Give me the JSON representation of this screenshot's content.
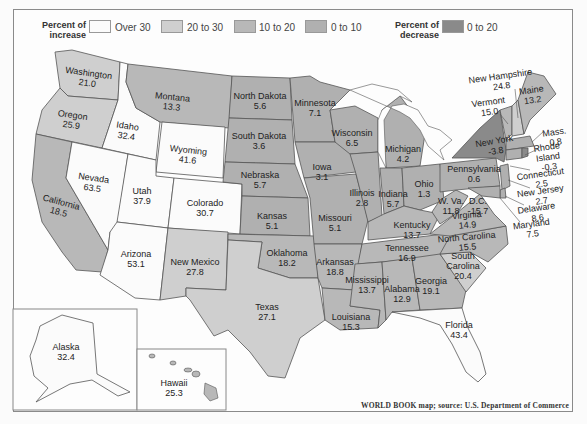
{
  "legend": {
    "increase_title": "Percent of increase",
    "increase_title_line1": "Percent of",
    "increase_title_line2": "increase",
    "decrease_title_line1": "Percent of",
    "decrease_title_line2": "decrease",
    "items": [
      {
        "label": "Over 30",
        "color": "#fbfbfb"
      },
      {
        "label": "20 to 30",
        "color": "#cfcfcf"
      },
      {
        "label": "10 to 20",
        "color": "#b8b8b8"
      },
      {
        "label": "0 to 10",
        "color": "#b0b0b0"
      },
      {
        "label": "0 to 20",
        "color": "#8a8a8a"
      }
    ]
  },
  "states": {
    "washington": {
      "name": "Washington",
      "value": "21.0"
    },
    "oregon": {
      "name": "Oregon",
      "value": "25.9"
    },
    "idaho": {
      "name": "Idaho",
      "value": "32.4"
    },
    "montana": {
      "name": "Montana",
      "value": "13.3"
    },
    "wyoming": {
      "name": "Wyoming",
      "value": "41.6"
    },
    "california": {
      "name": "California",
      "value": "18.5"
    },
    "nevada": {
      "name": "Nevada",
      "value": "63.5"
    },
    "utah": {
      "name": "Utah",
      "value": "37.9"
    },
    "colorado": {
      "name": "Colorado",
      "value": "30.7"
    },
    "arizona": {
      "name": "Arizona",
      "value": "53.1"
    },
    "new_mexico": {
      "name": "New Mexico",
      "value": "27.8"
    },
    "north_dakota": {
      "name": "North Dakota",
      "value": "5.6"
    },
    "south_dakota": {
      "name": "South Dakota",
      "value": "3.6"
    },
    "nebraska": {
      "name": "Nebraska",
      "value": "5.7"
    },
    "kansas": {
      "name": "Kansas",
      "value": "5.1"
    },
    "oklahoma": {
      "name": "Oklahoma",
      "value": "18.2"
    },
    "texas": {
      "name": "Texas",
      "value": "27.1"
    },
    "minnesota": {
      "name": "Minnesota",
      "value": "7.1"
    },
    "iowa": {
      "name": "Iowa",
      "value": "3.1"
    },
    "missouri": {
      "name": "Missouri",
      "value": "5.1"
    },
    "arkansas": {
      "name": "Arkansas",
      "value": "18.8"
    },
    "louisiana": {
      "name": "Louisiana",
      "value": "15.3"
    },
    "wisconsin": {
      "name": "Wisconsin",
      "value": "6.5"
    },
    "illinois": {
      "name": "Illinois",
      "value": "2.8"
    },
    "michigan": {
      "name": "Michigan",
      "value": "4.2"
    },
    "indiana": {
      "name": "Indiana",
      "value": "5.7"
    },
    "ohio": {
      "name": "Ohio",
      "value": "1.3"
    },
    "kentucky": {
      "name": "Kentucky",
      "value": "13.7"
    },
    "tennessee": {
      "name": "Tennessee",
      "value": "16.9"
    },
    "mississippi": {
      "name": "Mississippi",
      "value": "13.7"
    },
    "alabama": {
      "name": "Alabama",
      "value": "12.9"
    },
    "georgia": {
      "name": "Georgia",
      "value": "19.1"
    },
    "florida": {
      "name": "Florida",
      "value": "43.4"
    },
    "south_carolina": {
      "name": "South Carolina",
      "name_line1": "South",
      "name_line2": "Carolina",
      "value": "20.4"
    },
    "north_carolina": {
      "name": "North Carolina",
      "value": "15.5"
    },
    "virginia": {
      "name": "Virginia",
      "value": "14.9"
    },
    "west_virginia": {
      "name": "W. Va.",
      "value": "11.8"
    },
    "dc": {
      "name": "D.C.",
      "value": "-15.7"
    },
    "pennsylvania": {
      "name": "Pennsylvania",
      "value": "0.6"
    },
    "new_york": {
      "name": "New York",
      "value": "-3.8"
    },
    "vermont": {
      "name": "Vermont",
      "value": "15.0"
    },
    "new_hampshire": {
      "name": "New Hampshire",
      "value": "24.8"
    },
    "maine": {
      "name": "Maine",
      "value": "13.2"
    },
    "massachusetts": {
      "name": "Mass.",
      "value": "0.8"
    },
    "rhode_island": {
      "name": "Rhode Island",
      "name_line1": "Rhode",
      "name_line2": "Island",
      "value": "-0.3"
    },
    "connecticut": {
      "name": "Connecticut",
      "value": "2.5"
    },
    "new_jersey": {
      "name": "New Jersey",
      "value": "2.7"
    },
    "delaware": {
      "name": "Delaware",
      "value": "8.6"
    },
    "maryland": {
      "name": "Maryland",
      "value": "7.5"
    },
    "alaska": {
      "name": "Alaska",
      "value": "32.4"
    },
    "hawaii": {
      "name": "Hawaii",
      "value": "25.3"
    }
  },
  "source": "WORLD BOOK map; source: U.S. Department of Commerce"
}
